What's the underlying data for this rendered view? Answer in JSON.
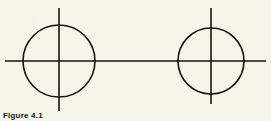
{
  "figure": {
    "background_color": "#f7f4e9",
    "ink_color": "#16130e",
    "caption": "Figure 4.1",
    "width": 271,
    "height": 121
  },
  "chart_data": {
    "type": "diagram",
    "title": "Figure 4.1",
    "xlabel": "",
    "ylabel": "",
    "grid": false,
    "legend": null,
    "axis_line": {
      "name": "horizontal-axis",
      "orientation": "horizontal",
      "y": 61,
      "x_start": 5,
      "x_end": 266,
      "stroke_width": 1.6
    },
    "vertical_lines": [
      {
        "name": "left-centerline",
        "x": 59,
        "y_start": 8,
        "y_end": 111,
        "stroke_width": 1.6
      },
      {
        "name": "right-centerline",
        "x": 211,
        "y_start": 8,
        "y_end": 104,
        "stroke_width": 1.6
      }
    ],
    "circles": [
      {
        "name": "left-circle",
        "cx": 59,
        "cy": 61,
        "r": 36,
        "stroke_width": 1.6,
        "fill": "none"
      },
      {
        "name": "right-circle",
        "cx": 211,
        "cy": 61,
        "r": 33,
        "stroke_width": 1.6,
        "fill": "none"
      }
    ]
  }
}
